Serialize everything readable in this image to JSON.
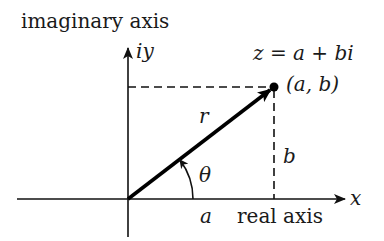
{
  "diagram": {
    "labels": {
      "imaginary_axis": "imaginary axis",
      "imag_var": "iy",
      "real_axis": "real axis",
      "real_var": "x",
      "equation": "z = a + bi",
      "point": "(a, b)",
      "radius": "r",
      "angle": "θ",
      "real_part": "a",
      "imag_part": "b"
    },
    "geometry": {
      "origin": [
        128,
        199
      ],
      "point": [
        274,
        87
      ],
      "x_axis": {
        "from": 17,
        "to": 345
      },
      "y_axis": {
        "from": 237,
        "to": 48
      },
      "angle_arc_radius": 65
    },
    "colors": {
      "ink": "#111111",
      "background": "#ffffff"
    }
  }
}
